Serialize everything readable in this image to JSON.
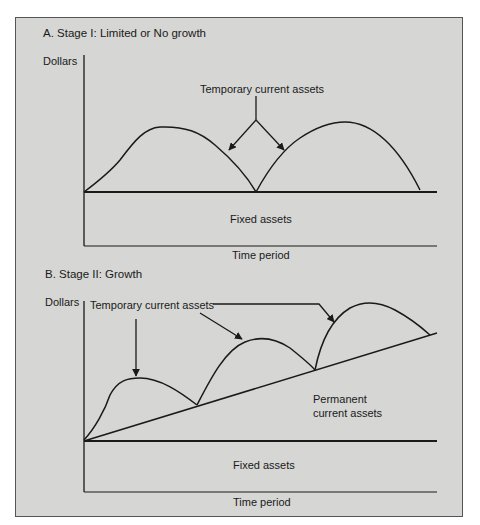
{
  "section_a": {
    "title": "A. Stage I: Limited or No growth",
    "y_axis_label": "Dollars",
    "x_axis_label": "Time period",
    "annotation": "Temporary current assets",
    "fixed_assets_label": "Fixed assets"
  },
  "section_b": {
    "title": "B. Stage II: Growth",
    "y_axis_label": "Dollars",
    "x_axis_label": "Time period",
    "annotation": "Temporary current assets",
    "permanent_label_line1": "Permanent",
    "permanent_label_line2": "current assets",
    "fixed_assets_label": "Fixed assets"
  },
  "colors": {
    "background": "#ffffff",
    "panel": "#d6d6d4",
    "line": "#1a1a1a"
  }
}
